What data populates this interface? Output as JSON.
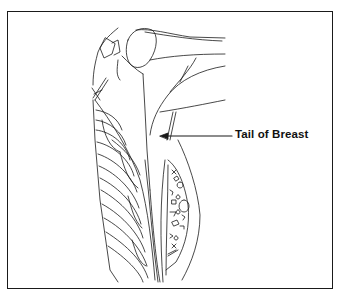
{
  "figure": {
    "label": "Tail of Breast",
    "colors": {
      "line": "#1a1a1a",
      "background": "#ffffff"
    }
  }
}
